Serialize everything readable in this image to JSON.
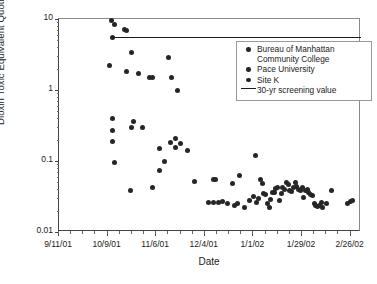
{
  "chart_data": {
    "type": "scatter",
    "title": "",
    "xlabel": "Date",
    "ylabel": "Dioxin Toxic Equivalent Quotient (pg/m3)",
    "ylabel_html": "Dioxin Toxic Equivalent Quotient (pg/m<sup>3</sup>)",
    "yscale": "log",
    "ylim": [
      0.01,
      10
    ],
    "ytick_labels": [
      "10",
      "1",
      "0.1",
      "0.01"
    ],
    "ytick_values": [
      10,
      1,
      0.1,
      0.01
    ],
    "xtick_labels": [
      "9/11/01",
      "10/9/01",
      "11/6/01",
      "12/4/01",
      "1/1/02",
      "1/29/02",
      "2/26/02"
    ],
    "xlim_labels": [
      "9/11/01",
      "3/5/02"
    ],
    "grid": false,
    "legend_position": "upper right",
    "legend": [
      {
        "label": "Bureau of Manhattan\nCommunity College",
        "marker": "filled-circle"
      },
      {
        "label": "Pace University",
        "marker": "filled-circle"
      },
      {
        "label": "Site K",
        "marker": "filled-circle"
      },
      {
        "label": "30-yr screening value",
        "marker": "line"
      }
    ],
    "annotations": [
      {
        "name": "30-yr screening value",
        "type": "hline",
        "y": 5.5,
        "x_start": "10/11/01",
        "x_end": "3/5/02"
      }
    ],
    "series": [
      {
        "name": "Bureau of Manhattan Community College",
        "marker": "filled-circle",
        "color": "#262626",
        "points": [
          {
            "x": "10/11/01",
            "y": 9.4
          },
          {
            "x": "10/13/01",
            "y": 8.3
          },
          {
            "x": "10/12/01",
            "y": 5.5
          },
          {
            "x": "10/19/01",
            "y": 7.1
          },
          {
            "x": "10/20/01",
            "y": 6.9
          },
          {
            "x": "10/10/01",
            "y": 2.2
          },
          {
            "x": "10/23/01",
            "y": 3.4
          },
          {
            "x": "11/13/01",
            "y": 2.9
          },
          {
            "x": "10/20/01",
            "y": 1.85
          },
          {
            "x": "10/27/01",
            "y": 1.7
          },
          {
            "x": "11/2/01",
            "y": 1.5
          },
          {
            "x": "11/4/01",
            "y": 1.5
          },
          {
            "x": "11/15/01",
            "y": 1.5
          },
          {
            "x": "11/18/01",
            "y": 0.97
          }
        ]
      },
      {
        "name": "Pace University",
        "marker": "filled-circle",
        "color": "#262626",
        "points": [
          {
            "x": "10/12/01",
            "y": 0.4
          },
          {
            "x": "10/12/01",
            "y": 0.27
          },
          {
            "x": "10/12/01",
            "y": 0.19
          },
          {
            "x": "10/13/01",
            "y": 0.094
          },
          {
            "x": "10/24/01",
            "y": 0.36
          },
          {
            "x": "10/23/01",
            "y": 0.3
          },
          {
            "x": "10/29/01",
            "y": 0.3
          },
          {
            "x": "11/8/01",
            "y": 0.15
          },
          {
            "x": "11/11/01",
            "y": 0.1
          },
          {
            "x": "11/14/01",
            "y": 0.185
          },
          {
            "x": "11/17/01",
            "y": 0.21
          },
          {
            "x": "11/17/01",
            "y": 0.155
          },
          {
            "x": "11/20/01",
            "y": 0.175
          },
          {
            "x": "11/24/01",
            "y": 0.14
          },
          {
            "x": "11/8/01",
            "y": 0.073
          },
          {
            "x": "11/4/01",
            "y": 0.043
          },
          {
            "x": "10/22/01",
            "y": 0.038
          },
          {
            "x": "11/28/01",
            "y": 0.051
          },
          {
            "x": "12/9/01",
            "y": 0.055
          },
          {
            "x": "12/10/01",
            "y": 0.055
          },
          {
            "x": "12/20/01",
            "y": 0.048
          },
          {
            "x": "12/24/01",
            "y": 0.063
          },
          {
            "x": "1/2/02",
            "y": 0.12
          }
        ]
      },
      {
        "name": "Site K",
        "marker": "filled-circle",
        "color": "#262626",
        "points": [
          {
            "x": "12/6/01",
            "y": 0.026
          },
          {
            "x": "12/9/01",
            "y": 0.026
          },
          {
            "x": "12/12/01",
            "y": 0.026
          },
          {
            "x": "12/14/01",
            "y": 0.027
          },
          {
            "x": "12/17/01",
            "y": 0.025
          },
          {
            "x": "12/21/01",
            "y": 0.024
          },
          {
            "x": "12/23/01",
            "y": 0.025
          },
          {
            "x": "12/27/01",
            "y": 0.022
          },
          {
            "x": "1/1/02",
            "y": 0.032
          },
          {
            "x": "1/3/02",
            "y": 0.026
          },
          {
            "x": "1/5/02",
            "y": 0.055
          },
          {
            "x": "1/6/02",
            "y": 0.048
          },
          {
            "x": "1/7/02",
            "y": 0.035
          },
          {
            "x": "1/8/02",
            "y": 0.034
          },
          {
            "x": "1/9/02",
            "y": 0.025
          },
          {
            "x": "1/10/02",
            "y": 0.022
          },
          {
            "x": "1/12/02",
            "y": 0.036
          },
          {
            "x": "1/13/02",
            "y": 0.036
          },
          {
            "x": "1/14/02",
            "y": 0.041
          },
          {
            "x": "1/15/02",
            "y": 0.043
          },
          {
            "x": "1/16/02",
            "y": 0.028
          },
          {
            "x": "1/18/02",
            "y": 0.042
          },
          {
            "x": "1/19/02",
            "y": 0.04
          },
          {
            "x": "1/20/02",
            "y": 0.05
          },
          {
            "x": "1/21/02",
            "y": 0.046
          },
          {
            "x": "1/22/02",
            "y": 0.039
          },
          {
            "x": "1/23/02",
            "y": 0.037
          },
          {
            "x": "1/24/02",
            "y": 0.043
          },
          {
            "x": "1/25/02",
            "y": 0.05
          },
          {
            "x": "1/26/02",
            "y": 0.044
          },
          {
            "x": "1/27/02",
            "y": 0.04
          },
          {
            "x": "1/28/02",
            "y": 0.038
          },
          {
            "x": "1/29/02",
            "y": 0.042
          },
          {
            "x": "1/30/02",
            "y": 0.031
          },
          {
            "x": "1/31/02",
            "y": 0.038
          },
          {
            "x": "2/1/02",
            "y": 0.04
          },
          {
            "x": "2/2/02",
            "y": 0.036
          },
          {
            "x": "2/3/02",
            "y": 0.034
          },
          {
            "x": "2/5/02",
            "y": 0.025
          },
          {
            "x": "2/6/02",
            "y": 0.024
          },
          {
            "x": "2/7/02",
            "y": 0.023
          },
          {
            "x": "2/8/02",
            "y": 0.024
          },
          {
            "x": "2/10/02",
            "y": 0.022
          },
          {
            "x": "2/12/02",
            "y": 0.025
          },
          {
            "x": "2/15/02",
            "y": 0.039
          },
          {
            "x": "2/24/02",
            "y": 0.025
          },
          {
            "x": "2/26/02",
            "y": 0.027
          },
          {
            "x": "2/27/02",
            "y": 0.028
          },
          {
            "x": "1/4/02",
            "y": 0.03
          },
          {
            "x": "1/11/02",
            "y": 0.029
          },
          {
            "x": "1/17/02",
            "y": 0.035
          },
          {
            "x": "2/4/02",
            "y": 0.033
          },
          {
            "x": "2/9/02",
            "y": 0.026
          },
          {
            "x": "12/30/01",
            "y": 0.028
          }
        ]
      }
    ]
  }
}
